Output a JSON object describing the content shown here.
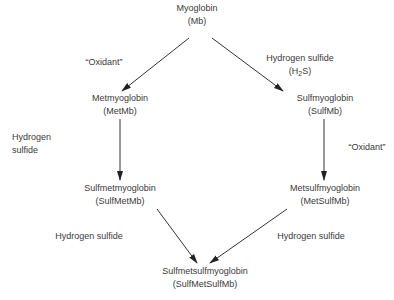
{
  "diagram": {
    "nodes": {
      "mb": {
        "name": "Myoglobin",
        "abbr": "(Mb)"
      },
      "metmb": {
        "name": "Metmyoglobin",
        "abbr": "(MetMb)"
      },
      "sulfmb": {
        "name": "Sulfmyoglobin",
        "abbr": "(SulfMb)"
      },
      "sulfmetmb": {
        "name": "Sulfmetmyoglobin",
        "abbr": "(SulfMetMb)"
      },
      "metsulfmb": {
        "name": "Metsulfmyoglobin",
        "abbr": "(MetSulfMb)"
      },
      "sulfmetsulfmb": {
        "name": "Sulfmetsulfmyoglobin",
        "abbr": "(SulfMetSulfMb)"
      }
    },
    "edges": {
      "mb_to_metmb": {
        "label": "“Oxidant”"
      },
      "mb_to_sulfmb": {
        "label_line1": "Hydrogen sulfide",
        "label_h": "(H",
        "label_sub": "2",
        "label_s": "S)"
      },
      "metmb_to_sulfmetmb": {
        "label_line1": "Hydrogen",
        "label_line2": "sulfide"
      },
      "sulfmb_to_metsulfmb": {
        "label": "“Oxidant”"
      },
      "sulfmetmb_to_final": {
        "label": "Hydrogen sulfide"
      },
      "metsulfmb_to_final": {
        "label": "Hydrogen sulfide"
      }
    },
    "colors": {
      "line": "#333333",
      "text": "#3a3a3a",
      "background": "#ffffff"
    }
  }
}
